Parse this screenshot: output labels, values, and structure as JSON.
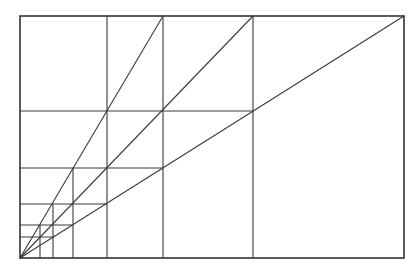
{
  "diagram": {
    "type": "geometric-proportion-construction",
    "stroke_color": "#3a3a3a",
    "background": "#ffffff",
    "frame": {
      "x1": 20,
      "y1": 16,
      "x2": 404,
      "y2": 258
    },
    "origin": {
      "x": 20,
      "y": 258
    },
    "diagonals": [
      {
        "x2": 163,
        "y2": 16
      },
      {
        "x2": 253,
        "y2": 16
      },
      {
        "x2": 404,
        "y2": 16
      }
    ],
    "verticals": [
      {
        "x": 253,
        "y1": 16,
        "y2": 258
      },
      {
        "x": 163,
        "y1": 16,
        "y2": 258
      },
      {
        "x": 107,
        "y1": 16,
        "y2": 258
      },
      {
        "x": 73,
        "y1": 168,
        "y2": 258
      },
      {
        "x": 53,
        "y1": 204,
        "y2": 258
      },
      {
        "x": 40,
        "y1": 225,
        "y2": 258
      }
    ],
    "horizontals": [
      {
        "y": 111,
        "x1": 20,
        "x2": 253
      },
      {
        "y": 168,
        "x1": 20,
        "x2": 163
      },
      {
        "y": 204,
        "x1": 20,
        "x2": 107
      },
      {
        "y": 225,
        "x1": 20,
        "x2": 73
      },
      {
        "y": 237,
        "x1": 20,
        "x2": 53
      }
    ]
  }
}
